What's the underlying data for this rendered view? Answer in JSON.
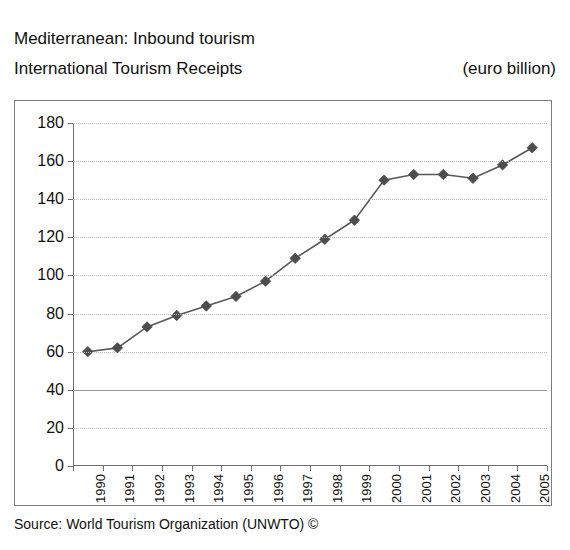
{
  "header": {
    "title_line1": "Mediterranean: Inbound tourism",
    "title_line2": "International Tourism Receipts",
    "units": "(euro billion)"
  },
  "footer": {
    "source": "Source: World Tourism Organization (UNWTO) ©"
  },
  "style": {
    "line_color": "#595959",
    "marker_color": "#4d4d4d",
    "grid_color": "#b9b9b9",
    "axis_color": "#6f6f6f",
    "frame_color": "#7d7d7d",
    "text_color": "#111111",
    "background": "#ffffff"
  },
  "chart_data": {
    "type": "line",
    "subtitle": "",
    "xlabel": "",
    "ylabel": "",
    "units": "(euro billion)",
    "categories": [
      "1990",
      "1991",
      "1992",
      "1993",
      "1994",
      "1995",
      "1996",
      "1997",
      "1998",
      "1999",
      "2000",
      "2001",
      "2002",
      "2003",
      "2004",
      "2005"
    ],
    "values": [
      60,
      62,
      73,
      79,
      84,
      89,
      97,
      109,
      119,
      129,
      150,
      153,
      153,
      151,
      158,
      167
    ],
    "series": [
      {
        "name": "International Tourism Receipts",
        "values": [
          60,
          62,
          73,
          79,
          84,
          89,
          97,
          109,
          119,
          129,
          150,
          153,
          153,
          151,
          158,
          167
        ]
      }
    ],
    "ylim": [
      0,
      180
    ],
    "yticks": [
      0,
      20,
      40,
      60,
      80,
      100,
      120,
      140,
      160,
      180
    ],
    "ytick_labels": [
      "0",
      "20",
      "40",
      "60",
      "80",
      "100",
      "120",
      "140",
      "160",
      "180"
    ],
    "xtick_labels": [
      "1990",
      "1991",
      "1992",
      "1993",
      "1994",
      "1995",
      "1996",
      "1997",
      "1998",
      "1999",
      "2000",
      "2001",
      "2002",
      "2003",
      "2004",
      "2005"
    ],
    "grid": true,
    "grid_style": "dotted",
    "emphasized_gridline": 40,
    "legend": false,
    "legend_position": "none",
    "marker": "diamond",
    "annotations": []
  }
}
